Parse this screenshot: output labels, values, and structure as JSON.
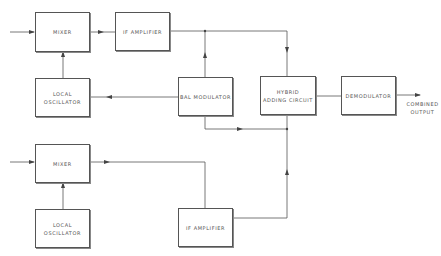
{
  "diagram": {
    "type": "block diagram",
    "blocks": {
      "mixer_top": {
        "label": "MIXER"
      },
      "if_amp_top": {
        "label": "IF AMPLIFIER"
      },
      "local_osc_top": {
        "label": "LOCAL OSCILLATOR"
      },
      "bal_modulator": {
        "label": "BAL MODULATOR"
      },
      "hybrid": {
        "label_line1": "HYBRID",
        "label_line2": "ADDING CIRCUIT"
      },
      "demodulator": {
        "label": "DEMODULATOR"
      },
      "mixer_bottom": {
        "label": "MIXER"
      },
      "local_osc_bottom": {
        "label": "LOCAL OSCILLATOR"
      },
      "if_amp_bottom": {
        "label": "IF AMPLIFIER"
      }
    },
    "output": {
      "line1": "COMBINED",
      "line2": "OUTPUT"
    },
    "connections": [
      {
        "from": "input",
        "to": "mixer_top"
      },
      {
        "from": "local_osc_top",
        "to": "mixer_top"
      },
      {
        "from": "mixer_top",
        "to": "if_amp_top"
      },
      {
        "from": "if_amp_top",
        "to": "hybrid"
      },
      {
        "from": "bal_modulator",
        "to": "if_amp_top_output"
      },
      {
        "from": "bal_modulator",
        "to": "local_osc_top"
      },
      {
        "from": "bal_modulator",
        "to": "hybrid_bottom_junction"
      },
      {
        "from": "input",
        "to": "mixer_bottom"
      },
      {
        "from": "local_osc_bottom",
        "to": "mixer_bottom"
      },
      {
        "from": "mixer_bottom",
        "to": "if_amp_bottom"
      },
      {
        "from": "if_amp_bottom",
        "to": "hybrid"
      },
      {
        "from": "hybrid",
        "to": "demodulator"
      },
      {
        "from": "demodulator",
        "to": "output"
      }
    ]
  }
}
